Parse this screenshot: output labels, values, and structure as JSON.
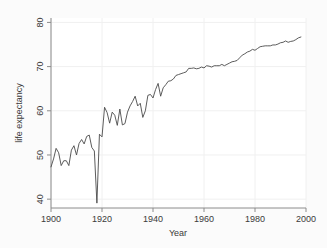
{
  "chart_data": {
    "type": "line",
    "title": "",
    "subtitle": "",
    "xlabel": "Year",
    "ylabel": "life expectancy",
    "xlim": [
      1900,
      2000
    ],
    "ylim": [
      38,
      81
    ],
    "xticks": [
      1900,
      1920,
      1940,
      1960,
      1980,
      2000
    ],
    "xticklabels": [
      "1900",
      "1920",
      "1940",
      "1960",
      "1980",
      "2000"
    ],
    "yticks": [
      40,
      50,
      60,
      70,
      80
    ],
    "yticklabels": [
      "40",
      "50",
      "60",
      "70",
      "80"
    ],
    "grid": true,
    "legend": null,
    "legend_position": "none",
    "line_color": "#4a4a4a",
    "series": [
      {
        "name": "life expectancy",
        "x": [
          1900,
          1901,
          1902,
          1903,
          1904,
          1905,
          1906,
          1907,
          1908,
          1909,
          1910,
          1911,
          1912,
          1913,
          1914,
          1915,
          1916,
          1917,
          1918,
          1919,
          1920,
          1921,
          1922,
          1923,
          1924,
          1925,
          1926,
          1927,
          1928,
          1929,
          1930,
          1931,
          1932,
          1933,
          1934,
          1935,
          1936,
          1937,
          1938,
          1939,
          1940,
          1941,
          1942,
          1943,
          1944,
          1945,
          1946,
          1947,
          1948,
          1949,
          1950,
          1951,
          1952,
          1953,
          1954,
          1955,
          1956,
          1957,
          1958,
          1959,
          1960,
          1961,
          1962,
          1963,
          1964,
          1965,
          1966,
          1967,
          1968,
          1969,
          1970,
          1971,
          1972,
          1973,
          1974,
          1975,
          1976,
          1977,
          1978,
          1979,
          1980,
          1981,
          1982,
          1983,
          1984,
          1985,
          1986,
          1987,
          1988,
          1989,
          1990,
          1991,
          1992,
          1993,
          1994,
          1995,
          1996,
          1997,
          1998
        ],
        "values": [
          47.3,
          49.1,
          51.5,
          50.5,
          47.6,
          48.7,
          48.7,
          47.6,
          51.1,
          52.1,
          50.0,
          52.6,
          53.5,
          52.5,
          54.2,
          54.5,
          51.7,
          50.9,
          39.1,
          54.7,
          54.1,
          60.8,
          59.6,
          57.2,
          59.7,
          59.0,
          56.7,
          60.4,
          56.8,
          57.1,
          59.7,
          61.1,
          62.1,
          63.3,
          61.1,
          61.7,
          58.5,
          60.0,
          63.5,
          63.7,
          62.9,
          64.8,
          66.2,
          63.3,
          65.2,
          65.9,
          66.7,
          66.8,
          67.2,
          68.0,
          68.2,
          68.4,
          68.6,
          68.8,
          69.6,
          69.6,
          69.7,
          69.5,
          69.6,
          69.9,
          69.7,
          70.2,
          70.1,
          69.9,
          70.2,
          70.2,
          70.2,
          70.5,
          70.2,
          70.5,
          70.8,
          71.1,
          71.2,
          71.4,
          72.0,
          72.6,
          72.9,
          73.3,
          73.5,
          73.9,
          73.7,
          74.1,
          74.5,
          74.6,
          74.7,
          74.7,
          74.7,
          74.9,
          74.9,
          75.1,
          75.4,
          75.5,
          75.8,
          75.5,
          75.7,
          75.8,
          76.1,
          76.5,
          76.7
        ]
      }
    ]
  },
  "annotations": {
    "pandemic_note": ""
  }
}
